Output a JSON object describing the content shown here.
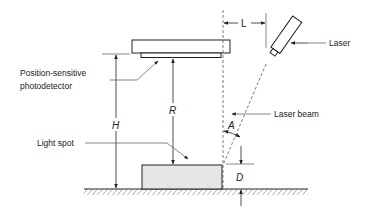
{
  "diagram": {
    "labels": {
      "laser": "Laser",
      "laser_beam": "Laser beam",
      "photodetector_line1": "Position-sensitive",
      "photodetector_line2": "photodetector",
      "light_spot": "Light spot"
    },
    "dimensions": {
      "L": "L",
      "H": "H",
      "R": "R",
      "A": "A",
      "D": "D"
    },
    "colors": {
      "stroke": "#222222",
      "block_fill": "#e6e6e6",
      "dim_line": "#555555"
    }
  }
}
